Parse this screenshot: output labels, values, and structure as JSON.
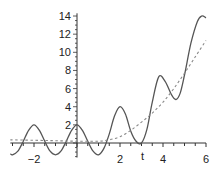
{
  "chart_data": {
    "type": "line",
    "title": "",
    "xlabel": "t",
    "ylabel": "",
    "xlim": [
      -3.1,
      6.0
    ],
    "ylim": [
      -1.6,
      14.3
    ],
    "grid": false,
    "x_ticks": [
      "-2",
      "2",
      "4",
      "6"
    ],
    "y_ticks": [
      "2",
      "4",
      "6",
      "8",
      "10",
      "12",
      "14"
    ],
    "series": [
      {
        "name": "oscillating",
        "style": "solid",
        "color": "#555555",
        "x": [
          -3.1,
          -3.0,
          -2.75,
          -2.5,
          -2.25,
          -2.0,
          -1.75,
          -1.5,
          -1.25,
          -1.0,
          -0.75,
          -0.5,
          -0.25,
          0.0,
          0.25,
          0.5,
          0.75,
          1.0,
          1.25,
          1.5,
          1.75,
          2.0,
          2.25,
          2.5,
          2.75,
          3.0,
          3.25,
          3.5,
          3.8,
          4.1,
          4.4,
          4.6,
          4.8,
          5.0,
          5.3,
          5.6,
          5.8,
          6.0
        ],
        "y": [
          -1.2,
          -1.3,
          -0.9,
          0.2,
          1.4,
          2.0,
          1.4,
          0.2,
          -0.9,
          -1.3,
          -0.9,
          0.2,
          1.4,
          2.0,
          1.4,
          0.2,
          -0.9,
          -1.3,
          -0.6,
          1.0,
          3.0,
          4.0,
          3.2,
          1.3,
          0.2,
          0.0,
          1.5,
          4.5,
          7.3,
          6.8,
          5.3,
          4.8,
          5.5,
          7.5,
          11.0,
          13.4,
          14.0,
          13.8
        ]
      },
      {
        "name": "trend",
        "style": "dashed",
        "color": "#888888",
        "x": [
          -3.1,
          -2.0,
          -1.0,
          0.0,
          1.0,
          1.5,
          2.0,
          2.5,
          3.0,
          3.5,
          4.0,
          4.5,
          5.0,
          5.5,
          6.0
        ],
        "y": [
          0.35,
          0.3,
          0.25,
          0.2,
          0.2,
          0.35,
          0.7,
          1.4,
          2.3,
          3.3,
          4.5,
          6.0,
          7.7,
          9.5,
          11.3
        ]
      }
    ]
  }
}
